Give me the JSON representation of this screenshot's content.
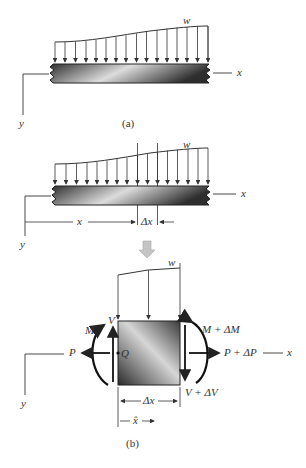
{
  "figure": {
    "panel_a": {
      "caption": "(a)",
      "load_label": "w",
      "x_axis_label": "x",
      "y_axis_label": "y"
    },
    "panel_b": {
      "caption": "(b)",
      "beam": {
        "load_label": "w",
        "x_axis_label": "x",
        "y_axis_label": "y",
        "position_label": "x",
        "segment_label": "Δx"
      },
      "element": {
        "load_label": "w",
        "left_moment": "M",
        "left_shear": "V",
        "left_axial": "P",
        "point_label": "Q",
        "right_moment": "M + ΔM",
        "right_axial": "P + ΔP",
        "right_shear": "V + ΔV",
        "x_axis_label": "x",
        "y_axis_label": "y",
        "width_label": "Δx",
        "centroid_label": "x̂"
      }
    },
    "colors": {
      "line": "#333333",
      "beam_dark": "#3a3a3a",
      "beam_light": "#d8d8d8",
      "transition_arrow": "#bdbdbd"
    }
  }
}
